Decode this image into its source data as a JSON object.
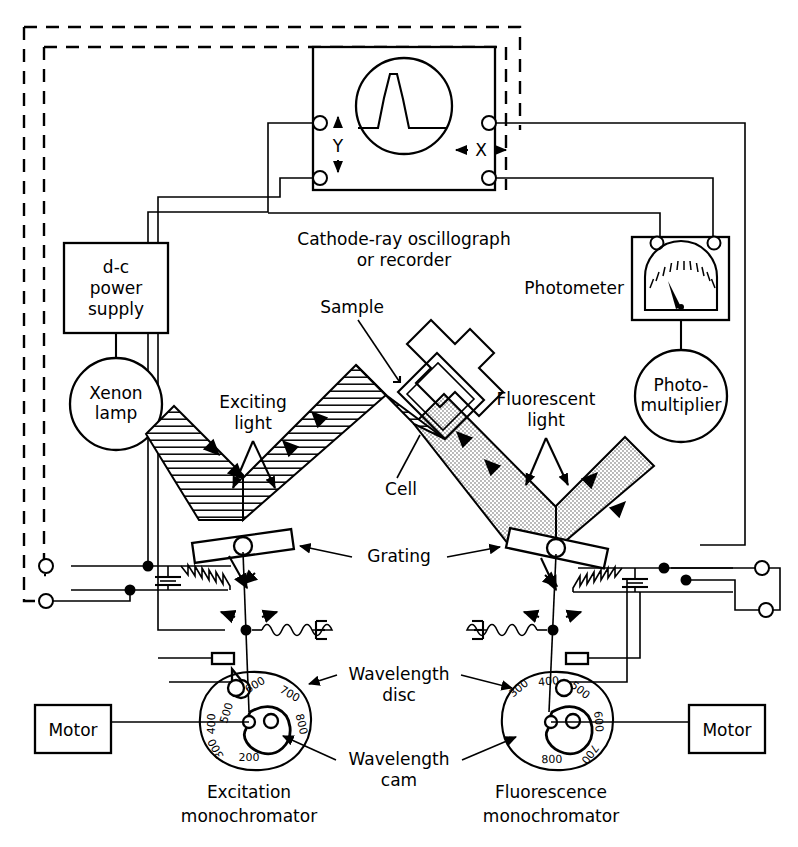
{
  "figure": {
    "type": "schematic-diagram"
  },
  "blocks": {
    "power_supply": "d-c\npower\nsupply",
    "power_supply_lines": [
      "d-c",
      "power",
      "supply"
    ],
    "xenon_lamp_lines": [
      "Xenon",
      "lamp"
    ],
    "photomultiplier_lines": [
      "Photo-",
      "multiplier"
    ],
    "motor_left": "Motor",
    "motor_right": "Motor",
    "photometer": "Photometer"
  },
  "labels": {
    "oscillograph_lines": [
      "Cathode-ray oscillograph",
      "or recorder"
    ],
    "sample": "Sample",
    "cell": "Cell",
    "exciting_light_lines": [
      "Exciting",
      "light"
    ],
    "fluorescent_light_lines": [
      "Fluorescent",
      "light"
    ],
    "grating": "Grating",
    "wavelength_disc_lines": [
      "Wavelength",
      "disc"
    ],
    "wavelength_cam_lines": [
      "Wavelength",
      "cam"
    ],
    "excitation_mono_lines": [
      "Excitation",
      "monochromator"
    ],
    "fluorescence_mono_lines": [
      "Fluorescence",
      "monochromator"
    ],
    "axis_y": "Y",
    "axis_x": "X",
    "ground_symbol": "E"
  },
  "dials": {
    "excitation": {
      "name": "Excitation wavelength disc",
      "ticks": [
        "200",
        "300",
        "400",
        "500",
        "600",
        "700",
        "800"
      ]
    },
    "fluorescence": {
      "name": "Fluorescence wavelength disc",
      "ticks": [
        "300",
        "400",
        "500",
        "600",
        "700",
        "800"
      ]
    }
  },
  "colors": {
    "ink": "#000000",
    "paper": "#ffffff",
    "exciting_beam_fill": "#ffffff",
    "fluorescent_beam_fill": "#d9d9d9"
  }
}
